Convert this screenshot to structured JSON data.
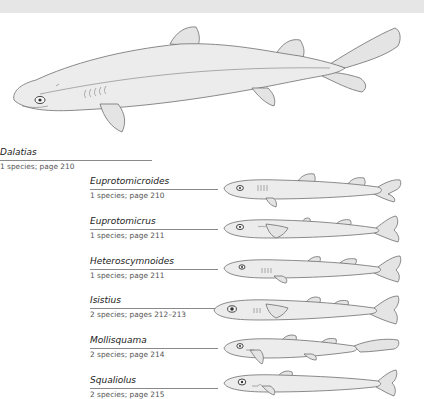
{
  "page": {
    "top_band_color": "#e6e6e6",
    "rule_color": "#8a8a8a"
  },
  "genera": [
    {
      "name": "Dalatias",
      "detail": "1 species; page 210",
      "illustration": "dalatias-shark-large"
    },
    {
      "name": "Euprotomicroides",
      "detail": "1 species; page 210",
      "illustration": "euprotomicroides-shark"
    },
    {
      "name": "Euprotomicrus",
      "detail": "1 species; page 211",
      "illustration": "euprotomicrus-shark"
    },
    {
      "name": "Heteroscymnoides",
      "detail": "1 species; page 211",
      "illustration": "heteroscymnoides-shark"
    },
    {
      "name": "Isistius",
      "detail": "2 species; pages 212–213",
      "illustration": "isistius-shark"
    },
    {
      "name": "Mollisquama",
      "detail": "2 species; page 214",
      "illustration": "mollisquama-shark"
    },
    {
      "name": "Squaliolus",
      "detail": "2 species; page 215",
      "illustration": "squaliolus-shark"
    }
  ]
}
